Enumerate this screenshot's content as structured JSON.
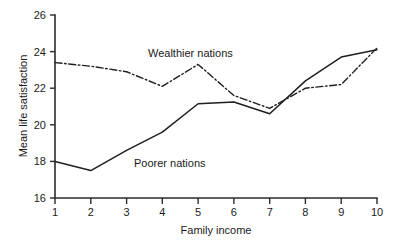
{
  "chart_data": {
    "type": "line",
    "title": "",
    "subtitle": "",
    "xlabel": "Family income",
    "ylabel": "Mean life satisfaction",
    "x": [
      1,
      2,
      3,
      4,
      5,
      6,
      7,
      8,
      9,
      10
    ],
    "xticklabels": [
      "1",
      "2",
      "3",
      "4",
      "5",
      "6",
      "7",
      "8",
      "9",
      "10"
    ],
    "yticks": [
      16,
      18,
      20,
      22,
      24,
      26
    ],
    "yticklabels": [
      "16",
      "18",
      "20",
      "22",
      "24",
      "26"
    ],
    "xlim": [
      1,
      10
    ],
    "ylim": [
      16,
      26
    ],
    "grid": false,
    "legend_position": "inline-annotations",
    "series": [
      {
        "name": "Wealthier nations",
        "style": "dash-dot",
        "color": "#1f1f1f",
        "values": [
          23.4,
          23.2,
          22.9,
          22.1,
          23.3,
          21.6,
          20.9,
          22.0,
          22.2,
          24.2
        ]
      },
      {
        "name": "Poorer nations",
        "style": "solid",
        "color": "#1f1f1f",
        "values": [
          18.0,
          17.5,
          18.6,
          19.6,
          21.15,
          21.25,
          20.6,
          22.4,
          23.7,
          24.1
        ]
      }
    ],
    "annotations": [
      {
        "text": "Wealthier nations",
        "x": 4.5,
        "y": 24.25
      },
      {
        "text": "Poorer nations",
        "x": 3.4,
        "y": 18.3
      }
    ]
  },
  "axes": {
    "x_title": "Family income",
    "y_title": "Mean life satisfaction"
  },
  "labels": {
    "y_26": "26",
    "y_24": "24",
    "y_22": "22",
    "y_20": "20",
    "y_18": "18",
    "y_16": "16",
    "x_1": "1",
    "x_2": "2",
    "x_3": "3",
    "x_4": "4",
    "x_5": "5",
    "x_6": "6",
    "x_7": "7",
    "x_8": "8",
    "x_9": "9",
    "x_10": "10"
  },
  "annotations": {
    "wealthier": "Wealthier nations",
    "poorer": "Poorer nations"
  },
  "colors": {
    "ink": "#1f1f1f",
    "axis": "#2b2b2b",
    "background": "#ffffff"
  }
}
